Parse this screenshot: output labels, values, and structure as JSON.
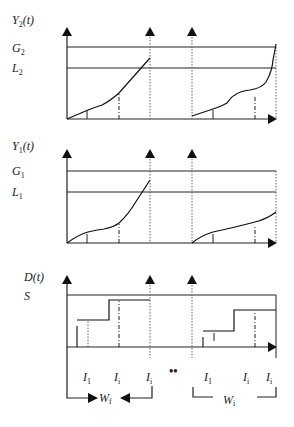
{
  "figure": {
    "panels": [
      {
        "id": "Y2",
        "y_label": "Y",
        "y_label_sub": "2",
        "y_label_arg": "(t)",
        "levels": [
          {
            "name": "G",
            "sub": "2"
          },
          {
            "name": "L",
            "sub": "2"
          }
        ]
      },
      {
        "id": "Y1",
        "y_label": "Y",
        "y_label_sub": "1",
        "y_label_arg": "(t)",
        "levels": [
          {
            "name": "G",
            "sub": "1"
          },
          {
            "name": "L",
            "sub": "1"
          }
        ]
      },
      {
        "id": "D",
        "y_label": "D(t)",
        "levels": [
          {
            "name": "S"
          }
        ]
      }
    ],
    "x_labels_left": [
      {
        "name": "I",
        "sub": "1"
      },
      {
        "name": "I",
        "sub": "i"
      },
      {
        "name": "I",
        "sub": "i"
      }
    ],
    "ellipsis": "••",
    "x_labels_right": [
      {
        "name": "I",
        "sub": "1"
      },
      {
        "name": "I",
        "sub": "i"
      },
      {
        "name": "I",
        "sub": "i"
      }
    ],
    "window_left": {
      "name": "W",
      "sub": "f"
    },
    "window_right": {
      "name": "W",
      "sub": "i"
    }
  }
}
